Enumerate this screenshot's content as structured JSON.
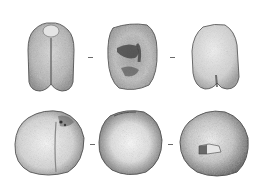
{
  "plate": {
    "background": "#ffffff",
    "ink_color": "#2a2a2a",
    "layout": "3x2 grid of stippled specimen views",
    "rows": [
      {
        "label": "top-row",
        "views": [
          {
            "id": "view-1",
            "description": "bilobed tooth, lingual/labial view with central groove"
          },
          {
            "id": "view-2",
            "description": "occlusal view with dark cusp depressions"
          },
          {
            "id": "view-3",
            "description": "tooth side view, lighter shading, notched base"
          }
        ]
      },
      {
        "label": "bottom-row",
        "views": [
          {
            "id": "view-4",
            "description": "rounded bilobed crown with small dark pits"
          },
          {
            "id": "view-5",
            "description": "globular crown, heavy peripheral stippling"
          },
          {
            "id": "view-6",
            "description": "ovoid crown with rectangular wear facet"
          }
        ]
      }
    ],
    "separators": [
      "-",
      "-",
      "-",
      "-"
    ]
  }
}
